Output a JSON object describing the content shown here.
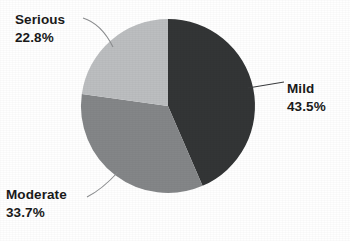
{
  "chart_data": {
    "type": "pie",
    "title": "",
    "subtitle": "",
    "xlabel": "",
    "ylabel": "",
    "legend_position": "none",
    "grid": false,
    "labels_outside": true,
    "leader_lines": true,
    "start_angle_deg": 0,
    "direction": "clockwise",
    "categories": [
      "Mild",
      "Moderate",
      "Serious"
    ],
    "values": [
      43.5,
      33.7,
      22.8
    ],
    "value_suffix": "%",
    "slices": [
      {
        "name": "Mild",
        "label": "Mild",
        "value": 43.5,
        "value_text": "43.5%",
        "color": "#333536",
        "start_deg": 0,
        "end_deg": 156.6
      },
      {
        "name": "Moderate",
        "label": "Moderate",
        "value": 33.7,
        "value_text": "33.7%",
        "color": "#848688",
        "start_deg": 156.6,
        "end_deg": 277.9
      },
      {
        "name": "Serious",
        "label": "Serious",
        "value": 22.8,
        "value_text": "22.8%",
        "color": "#bcbec0",
        "start_deg": 277.9,
        "end_deg": 360
      }
    ]
  },
  "labels": {
    "serious": {
      "name": "Serious",
      "value": "22.8%"
    },
    "mild": {
      "name": "Mild",
      "value": "43.5%"
    },
    "moderate": {
      "name": "Moderate",
      "value": "33.7%"
    }
  },
  "colors": {
    "mild": "#333536",
    "moderate": "#848688",
    "serious": "#bcbec0",
    "background": "#ffffff",
    "text": "#1a1a1a",
    "leader_line": "#8c8e90"
  }
}
